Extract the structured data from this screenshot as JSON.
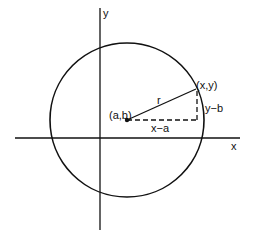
{
  "diagram": {
    "labels": {
      "y_axis": "y",
      "x_axis": "x",
      "center": "(a,b)",
      "point": "(x,y)",
      "radius": "r",
      "horizontal_leg": "x−a",
      "vertical_leg": "y−b"
    },
    "geometry": {
      "center": [
        127,
        120
      ],
      "radius": 77,
      "point": [
        196,
        89
      ],
      "x_axis_y": 138,
      "y_axis_x": 100
    },
    "colors": {
      "stroke": "#111111",
      "background": "#ffffff"
    }
  }
}
